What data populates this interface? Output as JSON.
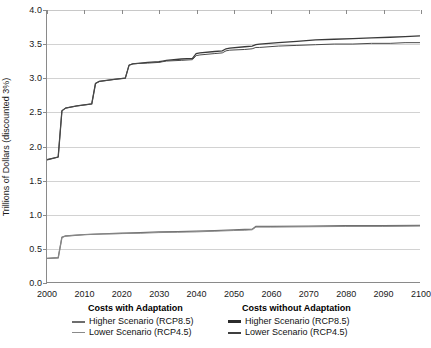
{
  "chart_data": {
    "type": "line",
    "title": "",
    "xlabel": "",
    "ylabel": "Trillions of Dollars (discounted 3%)",
    "xlim": [
      2000,
      2100
    ],
    "ylim": [
      0.0,
      4.0
    ],
    "xticks": [
      2000,
      2010,
      2020,
      2030,
      2040,
      2050,
      2060,
      2070,
      2080,
      2090,
      2100
    ],
    "yticks": [
      "0.0",
      "0.5",
      "1.0",
      "1.5",
      "2.0",
      "2.5",
      "3.0",
      "3.5",
      "4.0"
    ],
    "grid": "horizontal",
    "legend_position": "below-axis-two-columns",
    "series": [
      {
        "name": "Costs without Adaptation - Higher Scenario (RCP8.5)",
        "group": "Costs without Adaptation",
        "scenario": "Higher Scenario (RCP8.5)",
        "color": "#3a3a3a",
        "x": [
          2000,
          2003,
          2004,
          2005,
          2008,
          2012,
          2013,
          2014,
          2018,
          2021,
          2022,
          2023,
          2027,
          2030,
          2031,
          2032,
          2036,
          2039,
          2040,
          2041,
          2045,
          2047,
          2048,
          2049,
          2053,
          2055,
          2056,
          2057,
          2062,
          2067,
          2072,
          2077,
          2082,
          2087,
          2092,
          2096,
          2100
        ],
        "y": [
          1.8,
          1.84,
          2.52,
          2.56,
          2.59,
          2.62,
          2.92,
          2.95,
          2.98,
          3.0,
          3.19,
          3.21,
          3.23,
          3.24,
          3.25,
          3.26,
          3.28,
          3.29,
          3.36,
          3.37,
          3.39,
          3.4,
          3.43,
          3.44,
          3.46,
          3.47,
          3.49,
          3.5,
          3.52,
          3.54,
          3.56,
          3.57,
          3.58,
          3.59,
          3.6,
          3.61,
          3.62
        ]
      },
      {
        "name": "Costs without Adaptation - Lower Scenario (RCP4.5)",
        "group": "Costs without Adaptation",
        "scenario": "Lower Scenario (RCP4.5)",
        "color": "#4a4a4a",
        "x": [
          2000,
          2003,
          2004,
          2005,
          2008,
          2012,
          2013,
          2014,
          2018,
          2021,
          2022,
          2023,
          2027,
          2030,
          2031,
          2032,
          2036,
          2039,
          2040,
          2041,
          2045,
          2047,
          2048,
          2049,
          2053,
          2055,
          2056,
          2057,
          2062,
          2067,
          2072,
          2077,
          2082,
          2087,
          2092,
          2096,
          2100
        ],
        "y": [
          1.8,
          1.84,
          2.52,
          2.56,
          2.59,
          2.62,
          2.92,
          2.95,
          2.98,
          3.0,
          3.19,
          3.21,
          3.22,
          3.23,
          3.24,
          3.25,
          3.26,
          3.27,
          3.33,
          3.34,
          3.36,
          3.37,
          3.4,
          3.41,
          3.42,
          3.43,
          3.45,
          3.45,
          3.47,
          3.48,
          3.49,
          3.5,
          3.5,
          3.51,
          3.51,
          3.52,
          3.52
        ]
      },
      {
        "name": "Costs with Adaptation - Higher Scenario (RCP8.5)",
        "group": "Costs with Adaptation",
        "scenario": "Higher Scenario (RCP8.5)",
        "color": "#6e6e6e",
        "x": [
          2000,
          2003,
          2004,
          2005,
          2010,
          2015,
          2020,
          2025,
          2030,
          2035,
          2040,
          2045,
          2050,
          2053,
          2055,
          2056,
          2060,
          2070,
          2080,
          2090,
          2100
        ],
        "y": [
          0.35,
          0.36,
          0.66,
          0.68,
          0.7,
          0.71,
          0.72,
          0.73,
          0.74,
          0.745,
          0.75,
          0.76,
          0.77,
          0.775,
          0.78,
          0.82,
          0.82,
          0.825,
          0.83,
          0.83,
          0.835
        ]
      },
      {
        "name": "Costs with Adaptation - Lower Scenario (RCP4.5)",
        "group": "Costs with Adaptation",
        "scenario": "Lower Scenario (RCP4.5)",
        "color": "#8a8a8a",
        "x": [
          2000,
          2003,
          2004,
          2005,
          2010,
          2015,
          2020,
          2025,
          2030,
          2035,
          2040,
          2045,
          2050,
          2053,
          2055,
          2056,
          2060,
          2070,
          2080,
          2090,
          2100
        ],
        "y": [
          0.35,
          0.36,
          0.66,
          0.68,
          0.7,
          0.71,
          0.715,
          0.72,
          0.73,
          0.735,
          0.74,
          0.75,
          0.76,
          0.765,
          0.77,
          0.81,
          0.81,
          0.815,
          0.82,
          0.82,
          0.825
        ]
      }
    ]
  },
  "legend": {
    "columns": [
      {
        "title": "Costs with Adaptation",
        "entries": [
          {
            "label": "Higher Scenario (RCP8.5)",
            "color": "#6e6e6e",
            "thickness": "2px"
          },
          {
            "label": "Lower Scenario (RCP4.5)",
            "color": "#8a8a8a",
            "thickness": "1.5px"
          }
        ]
      },
      {
        "title": "Costs without Adaptation",
        "entries": [
          {
            "label": "Higher Scenario (RCP8.5)",
            "color": "#2b2b2b",
            "thickness": "3px"
          },
          {
            "label": "Lower Scenario (RCP4.5)",
            "color": "#3f3f3f",
            "thickness": "2px"
          }
        ]
      }
    ]
  },
  "colors": {
    "axis": "#8a8a8a",
    "grid": "#d2d2d2",
    "text": "#1a1a1a",
    "background": "#ffffff"
  }
}
